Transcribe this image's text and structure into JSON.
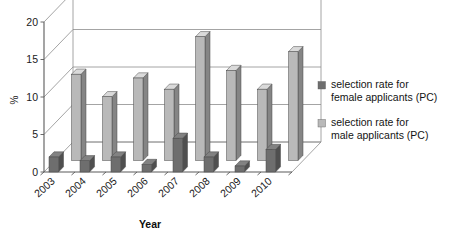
{
  "chart_data": {
    "type": "bar",
    "title": "",
    "subtitle": "",
    "xlabel": "Year",
    "ylabel": "%",
    "categories": [
      "2003",
      "2004",
      "2005",
      "2006",
      "2007",
      "2008",
      "2009",
      "2010"
    ],
    "series": [
      {
        "name": "selection rate for female applicants (PC)",
        "color": "#6e6e6e",
        "values": [
          2.0,
          1.5,
          2.0,
          1.0,
          4.5,
          2.0,
          0.8,
          3.0
        ]
      },
      {
        "name": "selection rate for male applicants (PC)",
        "color": "#b9b9b9",
        "values": [
          11.5,
          8.5,
          11.0,
          9.5,
          16.5,
          12.0,
          9.5,
          14.5
        ]
      }
    ],
    "ylim": [
      0,
      20
    ],
    "yticks": [
      0,
      5,
      10,
      15,
      20
    ],
    "ytick_labels": [
      "0",
      "5",
      "10",
      "15",
      "20"
    ],
    "grid": true,
    "grid_axis": "y",
    "legend_position": "right",
    "projection": "3d",
    "background": "#ffffff"
  },
  "legend": {
    "entries": [
      {
        "line1": "selection rate for",
        "line2": "female applicants (PC)",
        "swatch_color": "#6e6e6e"
      },
      {
        "line1": "selection rate for",
        "line2": "male applicants (PC)",
        "swatch_color": "#b9b9b9"
      }
    ]
  },
  "axes": {
    "y_title": "%",
    "x_title": "Year",
    "y_ticks": [
      "20",
      "15",
      "10",
      "5",
      "0"
    ],
    "x_ticks": [
      "2003",
      "2004",
      "2005",
      "2006",
      "2007",
      "2008",
      "2009",
      "2010"
    ]
  }
}
